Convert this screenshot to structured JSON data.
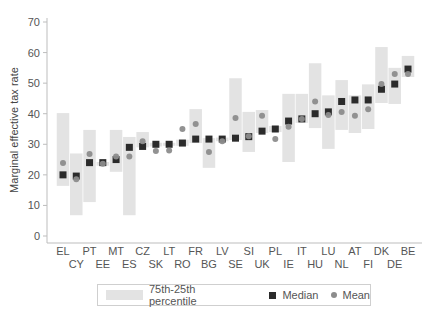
{
  "chart_data": {
    "type": "box-range",
    "title": "",
    "xlabel": "",
    "ylabel": "Marginal effective tax rate",
    "ylim": [
      0,
      70
    ],
    "yticks": [
      0,
      10,
      20,
      30,
      40,
      50,
      60,
      70
    ],
    "grid": false,
    "legend_position": "bottom",
    "categories": [
      "EL",
      "CY",
      "PT",
      "EE",
      "MT",
      "ES",
      "CZ",
      "SK",
      "LT",
      "RO",
      "FR",
      "BG",
      "LV",
      "SE",
      "SI",
      "UK",
      "PL",
      "IE",
      "IT",
      "HU",
      "LU",
      "NL",
      "AT",
      "FI",
      "DK",
      "DE",
      "BE"
    ],
    "series": [
      {
        "name": "75th-25th percentile (p75)",
        "values": [
          40.2,
          27.0,
          34.7,
          24.2,
          34.7,
          32.4,
          34.0,
          30.5,
          30.5,
          31.5,
          41.5,
          32.0,
          32.2,
          51.6,
          40.6,
          41.2,
          36.0,
          46.5,
          46.5,
          56.5,
          46.0,
          51.0,
          46.0,
          49.6,
          61.8,
          55.0,
          58.9
        ]
      },
      {
        "name": "75th-25th percentile (p25)",
        "values": [
          16.4,
          6.8,
          11.1,
          23.0,
          21.0,
          6.8,
          29.0,
          29.3,
          29.5,
          29.5,
          30.4,
          22.3,
          31.0,
          31.4,
          27.5,
          33.7,
          34.0,
          24.2,
          37.0,
          35.3,
          28.5,
          34.7,
          33.7,
          35.0,
          43.5,
          43.2,
          52.0
        ]
      },
      {
        "name": "Median",
        "values": [
          20.0,
          19.6,
          24.0,
          24.0,
          25.0,
          29.0,
          29.3,
          30.0,
          30.0,
          30.4,
          31.7,
          31.7,
          31.7,
          32.0,
          32.5,
          34.3,
          35.0,
          37.6,
          38.3,
          40.0,
          40.6,
          44.0,
          44.5,
          44.5,
          48.0,
          49.7,
          54.6
        ]
      },
      {
        "name": "Mean",
        "values": [
          23.9,
          18.6,
          26.8,
          23.6,
          26.0,
          26.0,
          31.0,
          27.8,
          28.0,
          35.0,
          36.6,
          27.5,
          31.0,
          38.6,
          32.6,
          39.3,
          31.7,
          35.7,
          38.3,
          44.0,
          39.6,
          40.6,
          39.3,
          41.5,
          49.7,
          53.0,
          53.0
        ]
      }
    ],
    "legend": [
      "75th-25th percentile",
      "Median",
      "Mean"
    ],
    "colors": {
      "range": "#e3e3e3",
      "median": "#2b2b2b",
      "mean": "#8c8c8c",
      "axis": "#bdbdbd"
    }
  },
  "legend": {
    "range_label": "75th-25th percentile",
    "median_label": "Median",
    "mean_label": "Mean"
  }
}
